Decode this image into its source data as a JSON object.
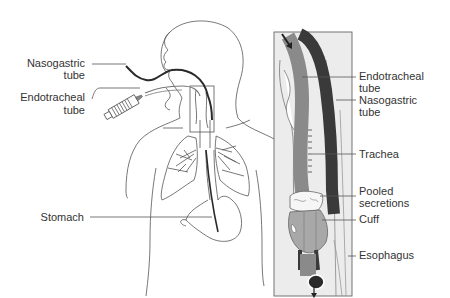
{
  "figure": {
    "left_panel": {
      "labels": [
        {
          "id": "nasogastric-tube",
          "lines": [
            "Nasogastric",
            "tube"
          ]
        },
        {
          "id": "endotracheal-tube",
          "lines": [
            "Endotracheal",
            "tube"
          ]
        },
        {
          "id": "stomach",
          "lines": [
            "Stomach"
          ]
        }
      ]
    },
    "right_panel": {
      "labels": [
        {
          "id": "endotracheal-tube",
          "lines": [
            "Endotracheal",
            "tube"
          ]
        },
        {
          "id": "nasogastric-tube",
          "lines": [
            "Nasogastric",
            "tube"
          ]
        },
        {
          "id": "trachea",
          "lines": [
            "Trachea"
          ]
        },
        {
          "id": "pooled-secretions",
          "lines": [
            "Pooled",
            "secretions"
          ]
        },
        {
          "id": "cuff",
          "lines": [
            "Cuff"
          ]
        },
        {
          "id": "esophagus",
          "lines": [
            "Esophagus"
          ]
        }
      ]
    },
    "colors": {
      "outline": "#555555",
      "nasogastric_tube": "#3a3a3a",
      "endotracheal_tube": "#8a8a8a",
      "cuff": "#a8a8a8",
      "panel_bg": "#ececec",
      "label_text": "#333333"
    }
  }
}
